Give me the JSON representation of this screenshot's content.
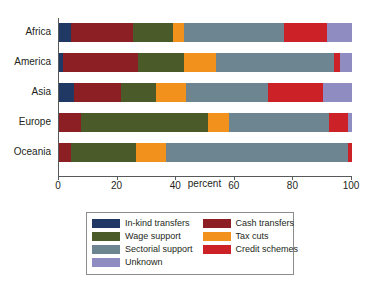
{
  "chart_data": {
    "type": "bar",
    "orientation": "horizontal",
    "stacked": true,
    "title": "",
    "xlabel": "percent",
    "ylabel": "",
    "xlim": [
      0,
      100
    ],
    "xticks": [
      0,
      20,
      40,
      60,
      80,
      100
    ],
    "grid": false,
    "legend_position": "bottom",
    "categories": [
      "Africa",
      "America",
      "Asia",
      "Europe",
      "Oceania"
    ],
    "series": [
      {
        "name": "In-kind transfers",
        "color": "#1f3864",
        "values": [
          4.1,
          1.5,
          5.2,
          0.0,
          0.0
        ]
      },
      {
        "name": "Cash transfers",
        "color": "#8c1f23",
        "values": [
          21.2,
          25.5,
          16.0,
          7.6,
          4.2
        ]
      },
      {
        "name": "Wage support",
        "color": "#4a5b29",
        "values": [
          13.6,
          15.6,
          11.8,
          43.3,
          22.0
        ]
      },
      {
        "name": "Tax cuts",
        "color": "#f2921d",
        "values": [
          3.7,
          11.1,
          10.4,
          7.1,
          10.2
        ]
      },
      {
        "name": "Sectorial support",
        "color": "#6d8591",
        "values": [
          34.2,
          40.3,
          28.1,
          34.0,
          62.1
        ]
      },
      {
        "name": "Credit schemes",
        "color": "#cc2127",
        "values": [
          14.6,
          2.0,
          18.5,
          6.5,
          1.5
        ]
      },
      {
        "name": "Unknown",
        "color": "#8e8cc0",
        "values": [
          8.6,
          4.0,
          10.0,
          1.5,
          0.0
        ]
      }
    ]
  },
  "axis": {
    "x_title": "percent",
    "x_tick_labels": [
      "0",
      "20",
      "40",
      "60",
      "80",
      "100"
    ],
    "y_tick_labels": [
      "Africa",
      "America",
      "Asia",
      "Europe",
      "Oceania"
    ]
  },
  "legend": {
    "column_left": [
      {
        "label": "In-kind transfers",
        "color": "#1f3864"
      },
      {
        "label": "Wage support",
        "color": "#4a5b29"
      },
      {
        "label": "Sectorial support",
        "color": "#6d8591"
      },
      {
        "label": "Unknown",
        "color": "#8e8cc0"
      }
    ],
    "column_right": [
      {
        "label": "Cash transfers",
        "color": "#8c1f23"
      },
      {
        "label": "Tax cuts",
        "color": "#f2921d"
      },
      {
        "label": "Credit schemes",
        "color": "#cc2127"
      }
    ]
  },
  "colors": {
    "in_kind_transfers": "#1f3864",
    "cash_transfers": "#8c1f23",
    "wage_support": "#4a5b29",
    "tax_cuts": "#f2921d",
    "sectorial_support": "#6d8591",
    "credit_schemes": "#cc2127",
    "unknown": "#8e8cc0",
    "axis": "#58595b",
    "text": "#231f20",
    "background": "#ffffff"
  }
}
